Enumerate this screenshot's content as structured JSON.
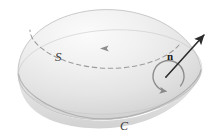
{
  "figure": {
    "background_color": "#ffffff",
    "width": 221,
    "height": 138
  },
  "labels": {
    "surface": "S",
    "boundary_curve": "C",
    "normal_vector": "n"
  },
  "colors": {
    "surface_light": "#f4f4f4",
    "surface_mid": "#e2e2e2",
    "surface_shadow": "#cfcfcf",
    "outline": "#b9b9b9",
    "dashed_curve": "#9a9a9a",
    "arrow": "#2b2b2b",
    "curl_arrow": "#8a8a8a",
    "label": "#3a3a3a"
  },
  "elements": {
    "dome": "hemispherical-surface",
    "rim": "boundary-circle",
    "dashed_latitude": "dashed-oriented-curve",
    "normal_arrow": "outward-unit-normal-arrow",
    "curl_circle": "counterclockwise-orientation-arrow"
  }
}
